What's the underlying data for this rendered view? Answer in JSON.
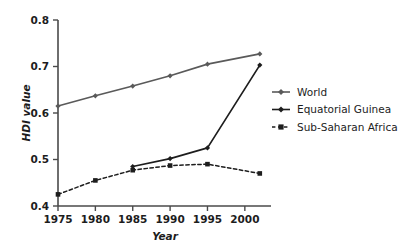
{
  "chart_data": {
    "type": "line",
    "title": "",
    "subtitle": "",
    "xlabel": "Year",
    "ylabel": "HDI value",
    "xlim": [
      1975,
      2003.5
    ],
    "ylim": [
      0.4,
      0.8
    ],
    "xticks": [
      "1975",
      "1980",
      "1985",
      "1990",
      "1995",
      "2000"
    ],
    "xtick_values": [
      1975,
      1980,
      1985,
      1990,
      1995,
      2000
    ],
    "yticks": [
      "0.4",
      "0.5",
      "0.6",
      "0.7",
      "0.8"
    ],
    "ytick_values": [
      0.4,
      0.5,
      0.6,
      0.7,
      0.8
    ],
    "grid": false,
    "legend_position": "right",
    "series": [
      {
        "name": "World",
        "x": [
          1975,
          1980,
          1985,
          1990,
          1995,
          2002
        ],
        "values": [
          0.615,
          0.637,
          0.658,
          0.68,
          0.705,
          0.727
        ],
        "line_style": "solid",
        "marker": "diamond",
        "color": "#5a5a5a"
      },
      {
        "name": "Equatorial Guinea",
        "x": [
          1985,
          1990,
          1995,
          2002
        ],
        "values": [
          0.485,
          0.502,
          0.525,
          0.703
        ],
        "line_style": "solid",
        "marker": "diamond",
        "color": "#1d1d1d"
      },
      {
        "name": "Sub-Saharan Africa",
        "x": [
          1975,
          1980,
          1985,
          1990,
          1995,
          2002
        ],
        "values": [
          0.425,
          0.455,
          0.477,
          0.487,
          0.49,
          0.47
        ],
        "line_style": "dashed",
        "marker": "square",
        "color": "#1d1d1d"
      }
    ]
  },
  "legend": {
    "entries": [
      {
        "label": "World"
      },
      {
        "label": "Equatorial Guinea"
      },
      {
        "label": "Sub-Saharan Africa"
      }
    ]
  },
  "axes": {
    "y_title": "HDI value",
    "x_title": "Year"
  }
}
